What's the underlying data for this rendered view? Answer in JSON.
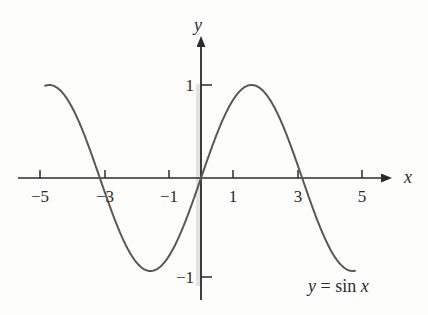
{
  "figure": {
    "background_color": "#fdfdfc",
    "axis_color": "#2b2b2b",
    "curve_color": "#585858",
    "text_color": "#2b2b2b",
    "artifact_color": "#dededa"
  },
  "axes": {
    "x_axis_name": "x",
    "y_axis_name": "y",
    "x_axis_name_pos": {
      "left": 404,
      "top": 168
    },
    "y_axis_name_pos": {
      "left": 194,
      "top": 16
    },
    "origin_px": {
      "x": 201,
      "y": 178
    },
    "px_per_unit_x": 32.2,
    "px_per_unit_y": 93,
    "x_axis_span_px": {
      "start": 18,
      "end": 392
    },
    "y_axis_span_px": {
      "start": 38,
      "end": 300
    },
    "arrowheads": [
      "x-axis-right",
      "y-axis-top"
    ]
  },
  "ticks": {
    "x": [
      {
        "value": -5,
        "label": "−5",
        "px": 40
      },
      {
        "value": -3,
        "label": "−3",
        "px": 105
      },
      {
        "value": -1,
        "label": "−1",
        "px": 169
      },
      {
        "value": 1,
        "label": "1",
        "px": 233
      },
      {
        "value": 3,
        "label": "3",
        "px": 298
      },
      {
        "value": 5,
        "label": "5",
        "px": 362
      }
    ],
    "y": [
      {
        "value": 1,
        "label": "1",
        "px": 85
      },
      {
        "value": -1,
        "label": "−1",
        "px": 277
      }
    ],
    "x_tick_direction": "up",
    "y_tick_direction": "right",
    "x_tick_length_px": 8,
    "y_tick_length_px": 11
  },
  "annotations": {
    "curve_equation_y": "y",
    "curve_equation_eq": "=",
    "curve_equation_fn": "sin",
    "curve_equation_var": "x"
  },
  "chart_data": {
    "type": "line",
    "title": "",
    "subtitle": "",
    "xlabel": "x",
    "ylabel": "y",
    "xlim": [
      -5.6,
      5.9
    ],
    "ylim": [
      -1.5,
      1.5
    ],
    "grid": false,
    "legend": null,
    "annotations": [
      {
        "text": "y = sin x",
        "x": 3.3,
        "y": -1.07
      }
    ],
    "xticks": [
      -5,
      -3,
      -1,
      1,
      3,
      5
    ],
    "xticklabels": [
      "−5",
      "−3",
      "−1",
      "1",
      "3",
      "5"
    ],
    "yticks": [
      -1,
      1
    ],
    "yticklabels": [
      "−1",
      "1"
    ],
    "series": [
      {
        "name": "y = sin x",
        "formula": "sin(x)",
        "color": "#585858",
        "linewidth_px": 2,
        "x_start": -4.84,
        "x_end": 4.78,
        "x": [
          -4.84,
          -4.6,
          -4.4,
          -4.2,
          -4,
          -3.8,
          -3.6,
          -3.4,
          -3.2,
          -3,
          -2.8,
          -2.6,
          -2.4,
          -2.2,
          -2,
          -1.8,
          -1.6,
          -1.4,
          -1.2,
          -1,
          -0.8,
          -0.6,
          -0.4,
          -0.2,
          0,
          0.2,
          0.4,
          0.6,
          0.8,
          1,
          1.2,
          1.4,
          1.6,
          1.8,
          2,
          2.2,
          2.4,
          2.6,
          2.8,
          3,
          3.2,
          3.4,
          3.6,
          3.8,
          4,
          4.2,
          4.4,
          4.6,
          4.78
        ],
        "y": [
          0.99,
          0.994,
          0.952,
          0.872,
          0.757,
          0.612,
          0.443,
          0.256,
          0.058,
          -0.141,
          -0.335,
          -0.516,
          -0.675,
          -0.808,
          -0.909,
          -0.974,
          -1.0,
          -0.985,
          -0.932,
          -0.841,
          -0.717,
          -0.565,
          -0.389,
          -0.199,
          0,
          0.199,
          0.389,
          0.565,
          0.717,
          0.841,
          0.932,
          0.985,
          1.0,
          0.974,
          0.909,
          0.808,
          0.675,
          0.516,
          0.335,
          0.141,
          -0.058,
          -0.256,
          -0.443,
          -0.612,
          -0.757,
          -0.872,
          -0.952,
          -0.994,
          -0.996
        ]
      }
    ],
    "key_points": {
      "maxima": [
        {
          "x": 1.5708,
          "y": 1
        }
      ],
      "minima": [
        {
          "x": -1.5708,
          "y": -1
        }
      ],
      "zeros": [
        {
          "x": -3.1416,
          "y": 0
        },
        {
          "x": 0,
          "y": 0
        },
        {
          "x": 3.1416,
          "y": 0
        }
      ]
    }
  }
}
